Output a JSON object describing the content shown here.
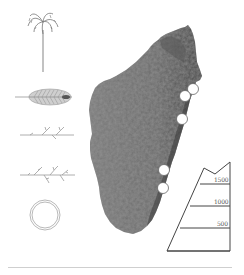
{
  "figure": {
    "colors": {
      "map_fill": "#6e6e6e",
      "map_dark": "#4a4a4a",
      "line": "#444444",
      "icon_line": "#8a8a8a",
      "marker_fill": "#ffffff",
      "rule": "#cfcfcf"
    }
  },
  "icons": [
    {
      "name": "palm-tree-icon",
      "label": "habit"
    },
    {
      "name": "leaf-icon",
      "label": "leaf"
    },
    {
      "name": "inflorescence-simple-icon",
      "label": "inflorescence branch"
    },
    {
      "name": "inflorescence-branched-icon",
      "label": "branched inflorescence"
    },
    {
      "name": "fruit-ring-icon",
      "label": "fruit cross-section"
    }
  ],
  "map": {
    "region": "Madagascar",
    "markers": [
      {
        "x": 193,
        "y": 89
      },
      {
        "x": 185,
        "y": 96
      },
      {
        "x": 182,
        "y": 119
      },
      {
        "x": 164,
        "y": 170
      },
      {
        "x": 163,
        "y": 188
      }
    ]
  },
  "elevation_scale": {
    "unit": "m",
    "ticks": [
      {
        "label": "1500",
        "y": 184
      },
      {
        "label": "1000",
        "y": 206
      },
      {
        "label": "500",
        "y": 228
      }
    ]
  }
}
